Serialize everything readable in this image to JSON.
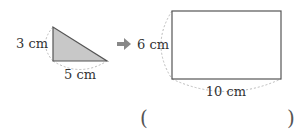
{
  "figure": {
    "triangle": {
      "height_label": "3 cm",
      "base_label": "5 cm",
      "fill_color": "#c8c8c8",
      "stroke_color": "#555555"
    },
    "arrow": {
      "icon": "right-arrow-icon",
      "color": "#888888"
    },
    "rectangle": {
      "height_label": "6 cm",
      "width_label": "10 cm",
      "fill_color": "#ffffff",
      "stroke_color": "#555555"
    },
    "answer": {
      "open_paren": "(",
      "close_paren": ")",
      "value": ""
    }
  }
}
